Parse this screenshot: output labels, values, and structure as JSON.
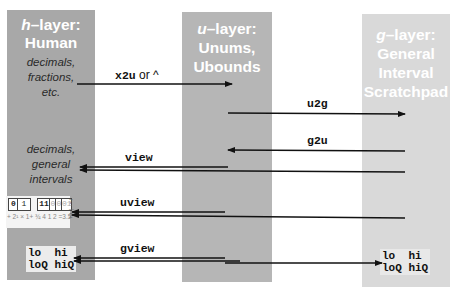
{
  "layers": {
    "h": {
      "prefix": "h",
      "title_rest": "–layer:",
      "subtitle": "Human",
      "note_top": [
        "decimals,",
        "fractions,",
        "etc."
      ],
      "note_bottom": [
        "decimals,",
        "general",
        "intervals"
      ],
      "color": "#a8a8a8"
    },
    "u": {
      "prefix": "u",
      "title_rest": "–layer:",
      "lines": [
        "Unums,",
        "Ubounds"
      ],
      "color": "#b6b6b6"
    },
    "g": {
      "prefix": "g",
      "title_rest": "–layer:",
      "lines": [
        "General",
        "Interval",
        "Scratchpad"
      ],
      "color": "#d9d9d9"
    }
  },
  "arrows": {
    "x2u": {
      "code": "x2u",
      "suffix": " or ^"
    },
    "u2g": {
      "code": "u2g"
    },
    "g2u": {
      "code": "g2u"
    },
    "view": {
      "code": "view"
    },
    "uview": {
      "code": "uview"
    },
    "gview": {
      "code": "gview"
    }
  },
  "unum_example": {
    "cells": [
      "0",
      "1",
      "11",
      "0",
      "0",
      "01"
    ],
    "formula": "+ 2¹ × 1+ ¾ 4 1 2 =3.5",
    "value_lines": [
      "7",
      "─",
      "2",
      "=3.5"
    ]
  },
  "interval_display": {
    "line1": "lo  hi",
    "line2": "loQ hiQ"
  }
}
